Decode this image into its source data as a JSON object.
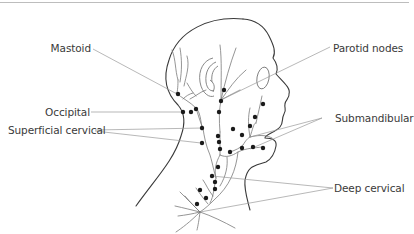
{
  "diagram": {
    "colors": {
      "outline": "#3a3a3a",
      "vessel": "#7a7a7a",
      "leader": "#9a9a9a",
      "node": "#1a1a1a",
      "text": "#3a3a3a"
    },
    "labels": {
      "mastoid": "Mastoid",
      "occipital": "Occipital",
      "superficial_cervical": "Superficial cervical",
      "parotid": "Parotid nodes",
      "submandibular": "Submandibular",
      "deep_cervical": "Deep cervical"
    }
  }
}
